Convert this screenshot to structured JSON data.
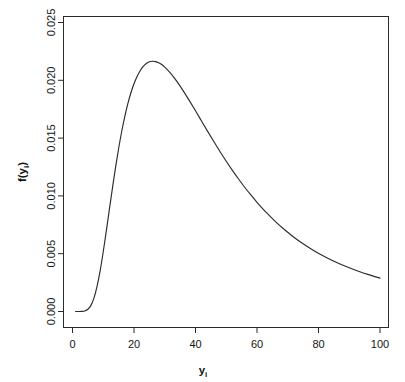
{
  "chart_data": {
    "type": "line",
    "title": "",
    "subtitle": "",
    "xlabel": "y",
    "xlabel_sub": "i",
    "ylabel": "f(y",
    "ylabel_sub": "i",
    "ylabel_close": ")",
    "xlim": [
      0,
      104
    ],
    "ylim": [
      0,
      0.026
    ],
    "xticks": [
      0,
      20,
      40,
      60,
      80,
      100
    ],
    "xtick_labels": [
      "0",
      "20",
      "40",
      "60",
      "80",
      "100"
    ],
    "yticks": [
      0,
      0.005,
      0.01,
      0.015,
      0.02,
      0.025
    ],
    "ytick_labels": [
      "0.000",
      "0.005",
      "0.010",
      "0.015",
      "0.020",
      "0.025"
    ],
    "grid": false,
    "legend": false,
    "legend_position": "none",
    "series": [
      {
        "name": "f(y_i)",
        "color": "#2b2b2b",
        "x": [
          1,
          2,
          3,
          4,
          5,
          6,
          7,
          8,
          9,
          10,
          11,
          12,
          13,
          14,
          15,
          16,
          17,
          18,
          19,
          20,
          21,
          22,
          23,
          24,
          25,
          26,
          27,
          28,
          29,
          30,
          32,
          34,
          36,
          38,
          40,
          42,
          44,
          46,
          48,
          50,
          52,
          54,
          56,
          58,
          60,
          63,
          66,
          69,
          72,
          75,
          78,
          81,
          84,
          87,
          90,
          93,
          96,
          100
        ],
        "y": [
          0.0,
          0.0,
          1e-05,
          5e-05,
          0.00019,
          0.00053,
          0.00118,
          0.00219,
          0.00354,
          0.00517,
          0.00697,
          0.00885,
          0.0107,
          0.01247,
          0.0141,
          0.01557,
          0.01686,
          0.01798,
          0.01892,
          0.0197,
          0.02033,
          0.02083,
          0.0212,
          0.02145,
          0.0216,
          0.02165,
          0.02162,
          0.02152,
          0.02136,
          0.02114,
          0.02058,
          0.01988,
          0.01909,
          0.01824,
          0.01736,
          0.01646,
          0.01556,
          0.01468,
          0.01382,
          0.013,
          0.01221,
          0.01146,
          0.01075,
          0.01008,
          0.00945,
          0.00857,
          0.00778,
          0.00707,
          0.00643,
          0.00586,
          0.00535,
          0.00489,
          0.00448,
          0.00411,
          0.00378,
          0.00348,
          0.00321,
          0.00289
        ],
        "peak_x": 23,
        "peak_y": 0.0243,
        "end_x": 100,
        "end_y": 0.00121
      }
    ]
  },
  "axes": {
    "x_axis_name": "x-axis",
    "y_axis_name": "y-axis"
  }
}
